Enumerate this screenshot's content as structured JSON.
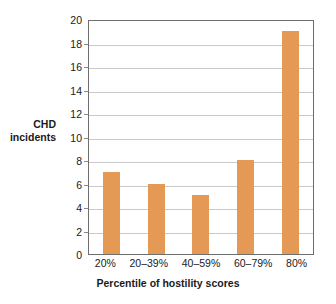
{
  "chart_data": {
    "type": "bar",
    "title": "",
    "categories": [
      "20%",
      "20–39%",
      "40–59%",
      "60–79%",
      "80%"
    ],
    "values": [
      7,
      6,
      5,
      8,
      19
    ],
    "xlabel": "Percentile of hostility scores",
    "ylabel": "CHD incidents",
    "ylabel_lines": [
      "CHD",
      "incidents"
    ],
    "ylim": [
      0,
      20
    ],
    "ytick_step": 2,
    "yticks": [
      0,
      2,
      4,
      6,
      8,
      10,
      12,
      14,
      16,
      18,
      20
    ],
    "ytick_labels": [
      "0",
      "2",
      "4",
      "6",
      "8",
      "10",
      "12",
      "14",
      "16",
      "18",
      "20"
    ],
    "grid": true,
    "grid_axis": "y",
    "legend": false,
    "bar_color": "#e49a55",
    "grid_color": "#c9c9c9",
    "frame_color": "#6e6e6e",
    "background_color": "#ffffff"
  }
}
